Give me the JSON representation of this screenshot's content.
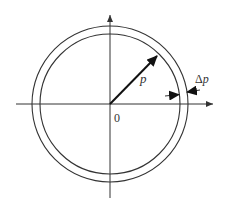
{
  "diagram": {
    "type": "annular-ring-radius-diagram",
    "colors": {
      "stroke": "#333333",
      "background": "#ffffff"
    },
    "origin": {
      "x": 110,
      "y": 104
    },
    "axes": {
      "horizontal": {
        "x_start": 16,
        "x_end": 213
      },
      "vertical": {
        "y_start": 15,
        "y_end": 198
      }
    },
    "circles": {
      "outer_radius_px": 78,
      "inner_radius_px": 70
    },
    "radius_arrow": {
      "to_x": 158,
      "to_y": 55
    },
    "labels": {
      "radius": "p",
      "delta_prefix": "Δ",
      "delta_var": "p",
      "origin": "0"
    }
  }
}
